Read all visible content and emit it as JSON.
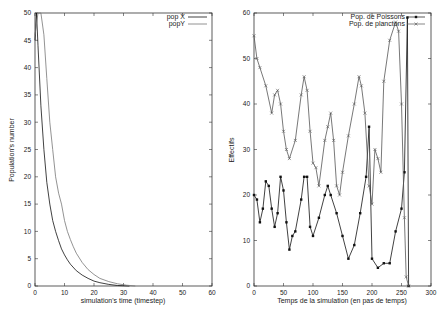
{
  "chart_data": [
    {
      "type": "line",
      "title": "",
      "xlabel": "simulation's time (timestep)",
      "ylabel": "Population's number",
      "xlim": [
        0,
        60
      ],
      "ylim": [
        0,
        50
      ],
      "xticks": [
        0,
        10,
        20,
        30,
        40,
        50,
        60
      ],
      "yticks": [
        0,
        5,
        10,
        15,
        20,
        25,
        30,
        35,
        40,
        45,
        50
      ],
      "grid": false,
      "legend_position": "top-right",
      "series": [
        {
          "name": "pop X",
          "color": "#111111",
          "x": [
            0,
            0.5,
            1,
            2,
            3,
            4,
            5,
            6,
            7,
            8,
            9,
            10,
            11,
            12,
            14,
            16,
            18,
            20,
            22,
            25,
            28,
            32
          ],
          "y": [
            45,
            50,
            44,
            33,
            25,
            19,
            15,
            12,
            10,
            8.3,
            6.8,
            5.7,
            4.8,
            4.0,
            2.8,
            2.0,
            1.4,
            0.9,
            0.6,
            0.3,
            0.1,
            0
          ]
        },
        {
          "name": "popY",
          "color": "#777777",
          "x": [
            0,
            1,
            2,
            3,
            4,
            5,
            6,
            7,
            8,
            9,
            10,
            11,
            12,
            13,
            14,
            16,
            18,
            20,
            22,
            25,
            28,
            31,
            34
          ],
          "y": [
            46,
            50,
            50,
            46,
            38,
            30,
            25,
            20,
            17,
            15,
            12,
            10,
            8.5,
            7.2,
            6.0,
            4.3,
            3.0,
            2.1,
            1.4,
            0.8,
            0.4,
            0.15,
            0
          ]
        }
      ]
    },
    {
      "type": "line",
      "title": "",
      "xlabel": "Temps de la simulation (en pas de temps)",
      "ylabel": "Effectifs",
      "xlim": [
        0,
        300
      ],
      "ylim": [
        0,
        60
      ],
      "xticks": [
        0,
        50,
        100,
        150,
        200,
        250,
        300
      ],
      "yticks": [
        0,
        10,
        20,
        30,
        40,
        50,
        60
      ],
      "grid": false,
      "legend_position": "top-right",
      "series": [
        {
          "name": "Pop. de Poissons",
          "marker": "filled-square",
          "color": "#111111",
          "x": [
            0,
            5,
            10,
            15,
            20,
            25,
            30,
            35,
            40,
            45,
            50,
            55,
            60,
            65,
            70,
            80,
            85,
            90,
            95,
            100,
            110,
            120,
            125,
            130,
            140,
            150,
            160,
            170,
            180,
            190,
            195,
            200,
            210,
            220,
            230,
            240,
            250,
            255,
            260,
            262
          ],
          "y": [
            20,
            19,
            14,
            17,
            23,
            22,
            17,
            13,
            16,
            24,
            21,
            14,
            8,
            11,
            12,
            19,
            24,
            24,
            13,
            11,
            15,
            20,
            22,
            20,
            16,
            11,
            6,
            9,
            16,
            24,
            35,
            6,
            4,
            5,
            5,
            12,
            17,
            25,
            59,
            0
          ]
        },
        {
          "name": "Pop. de planctons",
          "marker": "x",
          "color": "#555555",
          "x": [
            0,
            5,
            10,
            20,
            30,
            35,
            40,
            45,
            50,
            55,
            60,
            70,
            80,
            85,
            90,
            95,
            100,
            105,
            110,
            120,
            125,
            130,
            135,
            140,
            145,
            150,
            160,
            170,
            178,
            182,
            188,
            195,
            200,
            205,
            210,
            215,
            220,
            230,
            240,
            245,
            250,
            255,
            258,
            262
          ],
          "y": [
            55,
            50,
            48,
            44,
            38,
            42,
            43,
            40,
            34,
            30,
            28,
            32,
            42,
            46,
            43,
            34,
            27,
            26,
            22,
            32,
            35,
            38,
            32,
            22,
            20,
            25,
            33,
            40,
            46,
            44,
            38,
            22,
            18,
            30,
            28,
            25,
            45,
            54,
            58,
            56,
            40,
            15,
            2,
            0
          ]
        }
      ]
    }
  ],
  "left_plot": {
    "xlabel": "simulation's time (timestep)",
    "ylabel": "Population's number",
    "legend": [
      "pop X",
      "popY"
    ],
    "xtick_labels": [
      "0",
      "10",
      "20",
      "30",
      "40",
      "50",
      "60"
    ],
    "ytick_labels": [
      "0",
      "5",
      "10",
      "15",
      "20",
      "25",
      "30",
      "35",
      "40",
      "45",
      "50"
    ]
  },
  "right_plot": {
    "xlabel": "Temps de la simulation (en pas de temps)",
    "ylabel": "Effectifs",
    "legend": [
      "Pop. de Poissons",
      "Pop. de planctons"
    ],
    "xtick_labels": [
      "0",
      "50",
      "100",
      "150",
      "200",
      "250",
      "300"
    ],
    "ytick_labels": [
      "0",
      "10",
      "20",
      "30",
      "40",
      "50",
      "60"
    ]
  }
}
